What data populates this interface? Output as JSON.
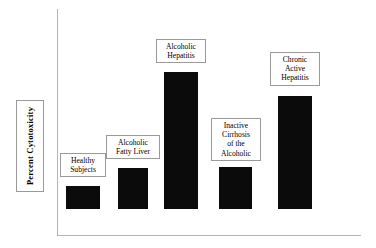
{
  "chart_data": {
    "type": "bar",
    "title": "",
    "subtitle": "",
    "xlabel": "",
    "ylabel": "Percent  Cytotoxicity",
    "legend": [],
    "grid": false,
    "axis": {
      "y_ticks": [],
      "x_ticks": [],
      "ylim": [
        0,
        100
      ],
      "y_axis_visible": true,
      "x_axis_visible": true
    },
    "categories": [
      "Healthy Subjects",
      "Alcoholic Fatty Liver",
      "Alcoholic Hepatitis",
      "Inactive Cirrhosis of the Alcoholic",
      "Chronic Active Hepatitis"
    ],
    "values": [
      17,
      30,
      100,
      31,
      82
    ],
    "bars": [
      {
        "category": "Healthy Subjects",
        "value": 17,
        "label_lines": [
          "Healthy",
          "Subjects"
        ],
        "color": "#0b0b0b",
        "px": {
          "left": 66,
          "width": 34,
          "top": 186,
          "height": 23
        },
        "label_px": {
          "left": 60,
          "top": 153,
          "width": 46
        }
      },
      {
        "category": "Alcoholic Fatty Liver",
        "value": 30,
        "label_lines": [
          "Alcoholic",
          "Fatty Liver"
        ],
        "color": "#0b0b0b",
        "px": {
          "left": 118,
          "width": 30,
          "top": 168,
          "height": 41
        },
        "label_px": {
          "left": 106,
          "top": 135,
          "width": 54
        }
      },
      {
        "category": "Alcoholic Hepatitis",
        "value": 100,
        "label_lines": [
          "Alcoholic",
          "Hepatitis"
        ],
        "color": "#0b0b0b",
        "px": {
          "left": 164,
          "width": 34,
          "top": 72,
          "height": 137
        },
        "label_px": {
          "left": 156,
          "top": 39,
          "width": 50
        }
      },
      {
        "category": "Inactive Cirrhosis of the Alcoholic",
        "value": 31,
        "label_lines": [
          "Inactive",
          "Cirrhosis",
          "of the",
          "Alcoholic"
        ],
        "color": "#0b0b0b",
        "px": {
          "left": 219,
          "width": 33,
          "top": 167,
          "height": 42
        },
        "label_px": {
          "left": 211,
          "top": 118,
          "width": 50
        }
      },
      {
        "category": "Chronic Active Hepatitis",
        "value": 82,
        "label_lines": [
          "Chronic",
          "Active",
          "Hepatitis"
        ],
        "color": "#0b0b0b",
        "px": {
          "left": 278,
          "width": 34,
          "top": 96,
          "height": 113
        },
        "label_px": {
          "left": 270,
          "top": 52,
          "width": 50
        }
      }
    ],
    "baseline_px": 209,
    "colors": {
      "bar": "#0b0b0b",
      "axis": "#b4b4b4",
      "box_border": "#9a9a9a",
      "background": "#ffffff",
      "text": "#000000"
    }
  }
}
